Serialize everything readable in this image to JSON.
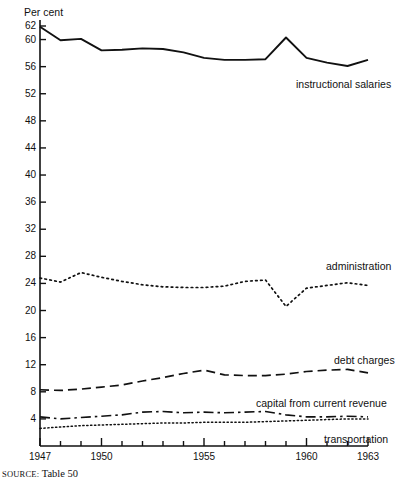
{
  "figure": {
    "source_note_prefix": "SOURCE:",
    "source_note_text": "Table 50",
    "y_axis_title": "Per cent"
  },
  "chart_data": {
    "type": "line",
    "title": "",
    "subtitle": "",
    "xlabel": "",
    "ylabel": "Per cent",
    "grid": false,
    "legend_position": "inline-right",
    "xlim": [
      1947,
      1963
    ],
    "ylim": [
      0,
      62
    ],
    "x": [
      1947,
      1948,
      1949,
      1950,
      1951,
      1952,
      1953,
      1954,
      1955,
      1956,
      1957,
      1958,
      1959,
      1960,
      1961,
      1962,
      1963
    ],
    "x_tick_labels": [
      "1947",
      "1950",
      "1955",
      "1960",
      "1963"
    ],
    "x_tick_values": [
      1947,
      1950,
      1955,
      1960,
      1963
    ],
    "x_minor_ticks": [
      1948,
      1949,
      1951,
      1952,
      1953,
      1954,
      1956,
      1957,
      1958,
      1959,
      1961,
      1962
    ],
    "y_tick_values": [
      4,
      8,
      12,
      16,
      20,
      24,
      28,
      32,
      36,
      40,
      44,
      48,
      52,
      56,
      60,
      62
    ],
    "y_tick_labels": [
      "4",
      "8",
      "12",
      "16",
      "20",
      "24",
      "28",
      "32",
      "36",
      "40",
      "44",
      "48",
      "52",
      "56",
      "60",
      "62"
    ],
    "series": [
      {
        "name": "instructional salaries",
        "label": "instructional salaries",
        "style": "solid",
        "color": "#111111",
        "values": [
          61.9,
          59.9,
          60.1,
          58.4,
          58.5,
          58.7,
          58.6,
          58.1,
          57.3,
          57.0,
          57.0,
          57.1,
          60.3,
          57.3,
          56.6,
          56.1,
          57.0
        ]
      },
      {
        "name": "administration",
        "label": "administration",
        "style": "dotted",
        "color": "#111111",
        "values": [
          24.8,
          24.2,
          25.6,
          24.9,
          24.3,
          23.8,
          23.5,
          23.4,
          23.4,
          23.6,
          24.3,
          24.5,
          20.6,
          23.3,
          23.7,
          24.1,
          23.7
        ]
      },
      {
        "name": "debt charges",
        "label": "debt charges",
        "style": "dashed",
        "color": "#111111",
        "values": [
          8.3,
          8.2,
          8.4,
          8.7,
          9.0,
          9.6,
          10.1,
          10.7,
          11.2,
          10.5,
          10.4,
          10.4,
          10.6,
          11.0,
          11.2,
          11.3,
          10.8
        ]
      },
      {
        "name": "capital from current revenue",
        "label": "capital from current revenue",
        "style": "dash-dot",
        "color": "#111111",
        "values": [
          4.3,
          4.0,
          4.2,
          4.4,
          4.6,
          5.0,
          5.1,
          4.9,
          5.0,
          4.9,
          5.0,
          5.1,
          4.6,
          4.3,
          4.3,
          4.4,
          4.3
        ]
      },
      {
        "name": "transportation",
        "label": "transportation",
        "style": "fine-dotted",
        "color": "#111111",
        "values": [
          2.6,
          2.8,
          3.0,
          3.1,
          3.2,
          3.3,
          3.4,
          3.4,
          3.5,
          3.5,
          3.5,
          3.6,
          3.7,
          3.8,
          3.9,
          4.0,
          4.0
        ]
      }
    ],
    "annotations": []
  }
}
